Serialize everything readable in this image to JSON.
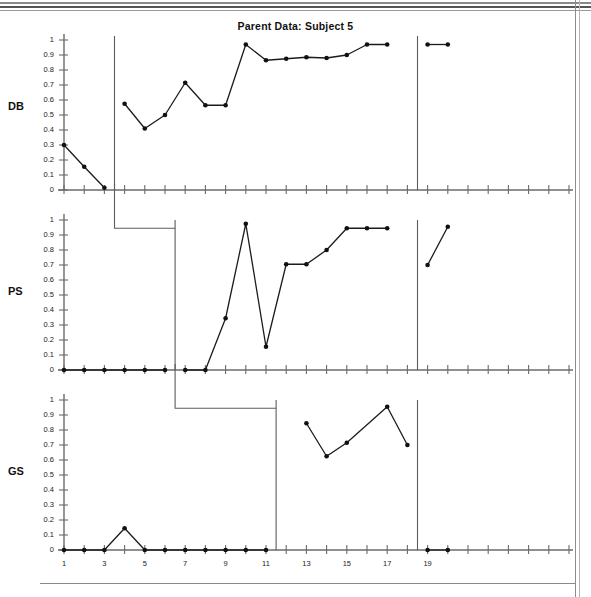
{
  "document": {
    "page_border": "scanned-page-edges"
  },
  "chart_data": {
    "type": "line",
    "title": "Parent Data: Subject 5",
    "xlabel": "",
    "ylabel": "",
    "ylim": [
      0,
      1
    ],
    "xlim": [
      1,
      26
    ],
    "grid": false,
    "legend": null,
    "design": "multiple-baseline across behaviors",
    "y_ticks": [
      "0",
      "0.1",
      "0.2",
      "0.3",
      "0.4",
      "0.5",
      "0.6",
      "0.7",
      "0.8",
      "0.9",
      "1"
    ],
    "y_tick_values": [
      0,
      0.1,
      0.2,
      0.3,
      0.4,
      0.5,
      0.6,
      0.7,
      0.8,
      0.9,
      1
    ],
    "x_ticks": [
      "1",
      "3",
      "5",
      "7",
      "9",
      "11",
      "13",
      "15",
      "17",
      "19"
    ],
    "x_tick_values": [
      1,
      3,
      5,
      7,
      9,
      11,
      13,
      15,
      17,
      19
    ],
    "x_all_ticks": [
      1,
      2,
      3,
      4,
      5,
      6,
      7,
      8,
      9,
      10,
      11,
      12,
      13,
      14,
      15,
      16,
      17,
      18,
      19,
      20,
      21,
      22,
      23,
      24,
      25,
      26
    ],
    "panels": [
      {
        "label": "DB",
        "name": "panel-db",
        "phase_line_x": 3.5,
        "post_phase_line_x": 18.5,
        "series": [
          {
            "name": "baseline",
            "points": [
              {
                "x": 1,
                "y": 0.3
              },
              {
                "x": 2,
                "y": 0.155
              },
              {
                "x": 3,
                "y": 0.015
              }
            ]
          },
          {
            "name": "intervention",
            "points": [
              {
                "x": 4,
                "y": 0.575
              },
              {
                "x": 5,
                "y": 0.41
              },
              {
                "x": 6,
                "y": 0.5
              },
              {
                "x": 7,
                "y": 0.715
              },
              {
                "x": 8,
                "y": 0.565
              },
              {
                "x": 9,
                "y": 0.565
              },
              {
                "x": 10,
                "y": 0.97
              },
              {
                "x": 11,
                "y": 0.865
              },
              {
                "x": 12,
                "y": 0.875
              },
              {
                "x": 13,
                "y": 0.885
              },
              {
                "x": 14,
                "y": 0.88
              },
              {
                "x": 15,
                "y": 0.9
              },
              {
                "x": 16,
                "y": 0.97
              },
              {
                "x": 17,
                "y": 0.97
              }
            ]
          },
          {
            "name": "follow-up",
            "points": [
              {
                "x": 19,
                "y": 0.97
              },
              {
                "x": 20,
                "y": 0.97
              }
            ]
          }
        ]
      },
      {
        "label": "PS",
        "name": "panel-ps",
        "phase_line_x": 6.5,
        "post_phase_line_x": 18.5,
        "series": [
          {
            "name": "baseline",
            "points": [
              {
                "x": 1,
                "y": 0.0
              },
              {
                "x": 2,
                "y": 0.0
              },
              {
                "x": 3,
                "y": 0.0
              },
              {
                "x": 4,
                "y": 0.0
              },
              {
                "x": 5,
                "y": 0.0
              },
              {
                "x": 6,
                "y": 0.0
              }
            ]
          },
          {
            "name": "intervention",
            "points": [
              {
                "x": 7,
                "y": 0.0
              },
              {
                "x": 8,
                "y": 0.0
              },
              {
                "x": 9,
                "y": 0.345
              },
              {
                "x": 10,
                "y": 0.975
              },
              {
                "x": 11,
                "y": 0.155
              },
              {
                "x": 12,
                "y": 0.705
              },
              {
                "x": 13,
                "y": 0.705
              },
              {
                "x": 14,
                "y": 0.8
              },
              {
                "x": 15,
                "y": 0.945
              },
              {
                "x": 16,
                "y": 0.945
              },
              {
                "x": 17,
                "y": 0.945
              }
            ]
          },
          {
            "name": "follow-up",
            "points": [
              {
                "x": 19,
                "y": 0.7
              },
              {
                "x": 20,
                "y": 0.955
              }
            ]
          }
        ]
      },
      {
        "label": "GS",
        "name": "panel-gs",
        "phase_line_x": 11.5,
        "post_phase_line_x": 18.5,
        "series": [
          {
            "name": "baseline",
            "points": [
              {
                "x": 1,
                "y": 0.0
              },
              {
                "x": 2,
                "y": 0.0
              },
              {
                "x": 3,
                "y": 0.0
              },
              {
                "x": 4,
                "y": 0.145
              },
              {
                "x": 5,
                "y": 0.0
              },
              {
                "x": 6,
                "y": 0.0
              },
              {
                "x": 7,
                "y": 0.0
              },
              {
                "x": 8,
                "y": 0.0
              },
              {
                "x": 9,
                "y": 0.0
              },
              {
                "x": 10,
                "y": 0.0
              },
              {
                "x": 11,
                "y": 0.0
              }
            ]
          },
          {
            "name": "intervention",
            "points": [
              {
                "x": 13,
                "y": 0.845
              },
              {
                "x": 14,
                "y": 0.625
              },
              {
                "x": 15,
                "y": 0.715
              },
              {
                "x": 17,
                "y": 0.955
              },
              {
                "x": 18,
                "y": 0.7
              }
            ]
          },
          {
            "name": "follow-up",
            "points": [
              {
                "x": 19,
                "y": 0.0
              },
              {
                "x": 20,
                "y": 0.0
              }
            ]
          }
        ]
      }
    ],
    "colors": {
      "line": "#1b1b1b",
      "marker": "#111111",
      "axis": "#6b6b6b",
      "phase_line": "#5c5c5c",
      "background": "#ffffff"
    }
  }
}
